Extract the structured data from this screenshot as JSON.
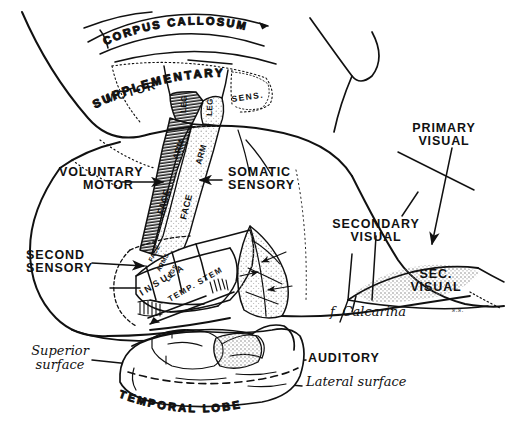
{
  "figure": {
    "kind": "anatomical-line-drawing",
    "style": "pen-and-ink hand drawing, black on white",
    "signature": "s.s."
  },
  "labels": {
    "corpus_callosum": "CORPUS CALLOSUM",
    "supplementary": "SUPPLEMENTARY",
    "supplementary_motor": "MOTOR",
    "supplementary_sens": "SENS.",
    "voluntary_motor_1": "VOLUNTARY",
    "voluntary_motor_2": "MOTOR",
    "somatic_sensory_1": "SOMATIC",
    "somatic_sensory_2": "SENSORY",
    "second_sensory_1": "SECOND",
    "second_sensory_2": "SENSORY",
    "primary_visual_1": "PRIMARY",
    "primary_visual_2": "VISUAL",
    "secondary_visual_1": "SECONDARY",
    "secondary_visual_2": "VISUAL",
    "sec_visual_1": "SEC.",
    "sec_visual_2": "VISUAL",
    "f_calcarina": "f. Calcarina",
    "auditory": "AUDITORY",
    "superior_surface_1": "Superior",
    "superior_surface_2": "surface",
    "lateral_surface": "Lateral surface",
    "temporal_lobe": "TEMPORAL LOBE",
    "insula": "INSULA",
    "temp_stem": "TEMP. STEM"
  },
  "homunculus": {
    "motor_strip": {
      "name": "precentral-gyrus",
      "shading": "hatched",
      "segments": [
        "LEG",
        "ARM",
        "FACE"
      ]
    },
    "sensory_strip": {
      "name": "postcentral-gyrus",
      "shading": "stippled",
      "segments": [
        "LEG",
        "ARM",
        "FACE"
      ]
    },
    "second_sensory": {
      "segments": [
        "FACE",
        "ARMS",
        "LEGS"
      ]
    }
  },
  "colors": {
    "ink": "#111111",
    "paper": "#ffffff",
    "stipple": "#9a9a9a"
  }
}
